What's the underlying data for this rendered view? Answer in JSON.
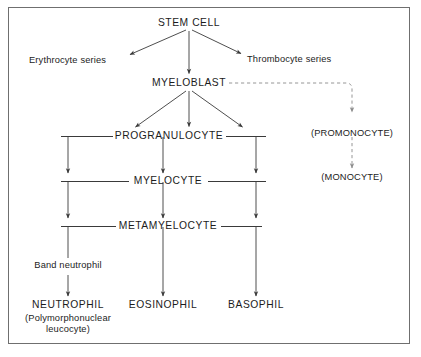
{
  "diagram": {
    "background_color": "#ffffff",
    "border_color": "#6f6f6f",
    "line_color": "#3a3a3a",
    "dashed_line_color": "#8a8a8a",
    "text_color": "#1c1c1c"
  },
  "nodes": {
    "stem_cell": "STEM CELL",
    "erythrocyte_series": "Erythrocyte series",
    "thrombocyte_series": "Thrombocyte series",
    "myeloblast": "MYELOBLAST",
    "progranulocyte": "PROGRANULOCYTE",
    "myelocyte": "MYELOCYTE",
    "metamyelocyte": "METAMYELOCYTE",
    "promonocyte": "(PROMONOCYTE)",
    "monocyte": "(MONOCYTE)",
    "band_neutrophil": "Band neutrophil",
    "neutrophil": "NEUTROPHIL",
    "neutrophil_sub_line1": "(Polymorphonuclear",
    "neutrophil_sub_line2": "leucocyte)",
    "eosinophil": "EOSINOPHIL",
    "basophil": "BASOPHIL"
  },
  "edges": [
    {
      "from": "stem_cell",
      "to": "erythrocyte_series",
      "style": "solid",
      "arrow": true
    },
    {
      "from": "stem_cell",
      "to": "thrombocyte_series",
      "style": "solid",
      "arrow": true
    },
    {
      "from": "stem_cell",
      "to": "myeloblast",
      "style": "solid",
      "arrow": true
    },
    {
      "from": "myeloblast",
      "to": "progranulocyte_left",
      "style": "solid",
      "arrow": true
    },
    {
      "from": "myeloblast",
      "to": "progranulocyte_center",
      "style": "solid",
      "arrow": true
    },
    {
      "from": "myeloblast",
      "to": "progranulocyte_right",
      "style": "solid",
      "arrow": true
    },
    {
      "from": "myeloblast",
      "to": "promonocyte",
      "style": "dashed",
      "arrow": true
    },
    {
      "from": "promonocyte",
      "to": "monocyte",
      "style": "dashed",
      "arrow": true
    },
    {
      "from": "progranulocyte",
      "to": "myelocyte",
      "style": "solid",
      "arrow": true,
      "lanes": 3
    },
    {
      "from": "myelocyte",
      "to": "metamyelocyte",
      "style": "solid",
      "arrow": true,
      "lanes": 3
    },
    {
      "from": "metamyelocyte",
      "to": "neutrophil",
      "style": "solid",
      "arrow": true,
      "label": "Band neutrophil"
    },
    {
      "from": "metamyelocyte",
      "to": "eosinophil",
      "style": "solid",
      "arrow": true
    },
    {
      "from": "metamyelocyte",
      "to": "basophil",
      "style": "solid",
      "arrow": true
    }
  ]
}
